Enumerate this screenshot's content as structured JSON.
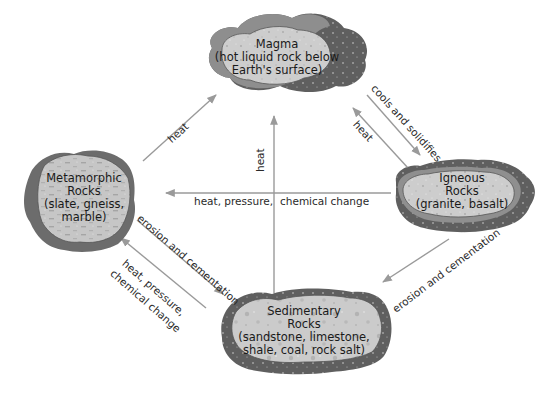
{
  "diagram": {
    "colors": {
      "background": "#ffffff",
      "arrow": "#9a9a9a",
      "rock_outer": "#6e6e6e",
      "rock_mid": "#9b9b9b",
      "rock_inner": "#cfcfcf",
      "text": "#1a1a1a"
    },
    "nodes": {
      "magma": {
        "name": "Magma",
        "lines": [
          "Magma",
          "(hot liquid rock below",
          "Earth's surface)"
        ]
      },
      "igneous": {
        "name": "Igneous Rocks",
        "lines": [
          "Igneous",
          "Rocks",
          "(granite, basalt)"
        ]
      },
      "metamorphic": {
        "name": "Metamorphic Rocks",
        "lines": [
          "Metamorphic",
          "Rocks",
          "(slate, gneiss,",
          "marble)"
        ]
      },
      "sedimentary": {
        "name": "Sedimentary Rocks",
        "lines": [
          "Sedimentary",
          "Rocks",
          "(sandstone, limestone,",
          "shale, coal, rock salt)"
        ]
      }
    },
    "edges": [
      {
        "from": "magma",
        "to": "igneous",
        "label": "cools and solidifies"
      },
      {
        "from": "igneous",
        "to": "magma",
        "label": "heat"
      },
      {
        "from": "metamorphic",
        "to": "magma",
        "label": "heat"
      },
      {
        "from": "sedimentary",
        "to": "magma",
        "label": "heat"
      },
      {
        "from": "igneous",
        "to": "metamorphic",
        "label_left": "heat, pressure,",
        "label_right": "chemical change"
      },
      {
        "from": "igneous",
        "to": "sedimentary",
        "label": "erosion and cementation"
      },
      {
        "from": "metamorphic",
        "to": "sedimentary",
        "label": "erosion and cementation"
      },
      {
        "from": "sedimentary",
        "to": "metamorphic",
        "label_line1": "heat, pressure,",
        "label_line2": "chemical change"
      }
    ]
  }
}
